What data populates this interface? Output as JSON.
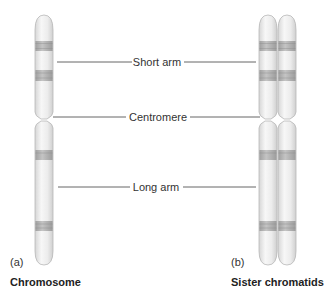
{
  "labels": {
    "short_arm": "Short arm",
    "centromere": "Centromere",
    "long_arm": "Long arm"
  },
  "panels": {
    "a": {
      "letter": "(a)",
      "caption": "Chromosome"
    },
    "b": {
      "letter": "(b)",
      "caption": "Sister chromatids"
    }
  },
  "colors": {
    "chromosome_fill": "#ececec",
    "chromosome_edge": "#b8b8b8",
    "band": "#a8a8a8",
    "leader_line": "#555555",
    "text": "#333333"
  }
}
